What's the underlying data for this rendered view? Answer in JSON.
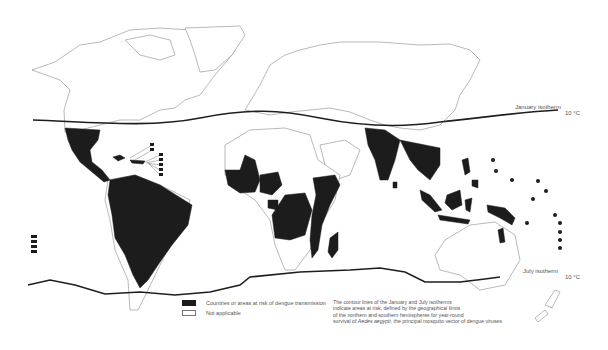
{
  "map": {
    "title": "Dengue risk world map",
    "colors": {
      "risk": "#1c1c1c",
      "not_applicable": "#ffffff",
      "isotherm": "#1e1e1e",
      "border": "#8a8a8a"
    },
    "isotherms": {
      "january": {
        "label": "January isotherm",
        "value": "10 °C"
      },
      "july": {
        "label": "July isotherm",
        "value": "10 °C"
      }
    },
    "risk_regions": [
      "Mexico",
      "Central America",
      "Caribbean",
      "South America",
      "West Africa",
      "Central Africa",
      "East Africa",
      "Madagascar",
      "India",
      "Southeast Asia",
      "Indonesia",
      "Papua New Guinea",
      "Northern Australia",
      "Pacific Islands"
    ]
  },
  "legend": {
    "items": [
      {
        "swatch": "risk",
        "label": "Countries or areas at risk of dengue transmission"
      },
      {
        "swatch": "not_applicable",
        "label": "Not applicable"
      }
    ]
  },
  "note": {
    "line1": "The contour lines of the January and July isotherms",
    "line2": "indicate areas at risk, defined by the geographical limits",
    "line3": "of the northern and southern hemispheres for year-round",
    "line4_pre": "survival of ",
    "line4_species": "Aedes aegypti",
    "line4_post": ", the principal mosquito vector of dengue viruses"
  }
}
